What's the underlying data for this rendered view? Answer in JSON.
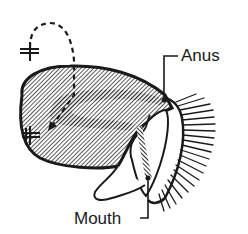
{
  "figure": {
    "colors": {
      "ink": "#1a1a1a",
      "background": "#ffffff",
      "hatch": "#333333"
    },
    "symbols": [
      {
        "name": "double-bar-cross-top",
        "glyph": "+"
      },
      {
        "name": "double-bar-cross-body",
        "glyph": "+"
      }
    ]
  },
  "labels": {
    "anus": "Anus",
    "mouth": "Mouth"
  }
}
